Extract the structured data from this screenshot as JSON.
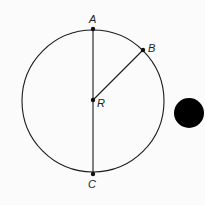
{
  "diagram": {
    "type": "circle-geometry",
    "circle": {
      "center_label": "R",
      "cx": 93,
      "cy": 101,
      "r": 71
    },
    "points": [
      {
        "label": "A",
        "x": 93,
        "y": 29,
        "label_x": 89,
        "label_y": 23
      },
      {
        "label": "B",
        "x": 143,
        "y": 50,
        "label_x": 148,
        "label_y": 52
      },
      {
        "label": "R",
        "x": 93,
        "y": 100,
        "label_x": 97,
        "label_y": 107
      },
      {
        "label": "C",
        "x": 93,
        "y": 174,
        "label_x": 88,
        "label_y": 188
      }
    ],
    "segments": [
      {
        "from": "A",
        "to": "C",
        "name": "diameter"
      },
      {
        "from": "R",
        "to": "B",
        "name": "radius"
      }
    ],
    "marker": {
      "shape": "filled-circle",
      "cx": 189,
      "cy": 113,
      "r": 15,
      "color": "#000000"
    },
    "colors": {
      "stroke": "#1a1a1a",
      "background": "#fbfbfb"
    }
  }
}
